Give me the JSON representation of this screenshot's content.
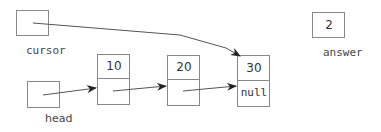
{
  "variables": {
    "cursor": {
      "label": "cursor"
    },
    "answer": {
      "label": "answer",
      "value": "2"
    },
    "head": {
      "label": "head"
    }
  },
  "nodes": [
    {
      "data": "10",
      "next": ""
    },
    {
      "data": "20",
      "next": ""
    },
    {
      "data": "30",
      "next": "null"
    }
  ],
  "colors": {
    "stroke": "#888888",
    "arrow": "#333333",
    "text": "#333333"
  }
}
